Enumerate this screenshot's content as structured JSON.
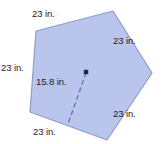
{
  "figure": {
    "kind": "regular-pentagon-with-apothem",
    "fill_color": "#b9c5ec",
    "stroke_color": "#8f9dc8",
    "center_dot_color": "#1b2a55",
    "dashed_line_color": "#6b7bb0",
    "text_color": "#1c1c1c",
    "vertices": [
      {
        "name": "top-left",
        "x": 36,
        "y": 31
      },
      {
        "name": "top-right",
        "x": 113,
        "y": 11
      },
      {
        "name": "right",
        "x": 152,
        "y": 73
      },
      {
        "name": "bottom-right",
        "x": 107,
        "y": 140
      },
      {
        "name": "bottom-left",
        "x": 30,
        "y": 112
      }
    ],
    "center": {
      "x": 86,
      "y": 72
    },
    "apothem_foot": {
      "x": 68,
      "y": 124
    }
  },
  "labels": {
    "side_top": "23 in.",
    "side_top_right": "23 in.",
    "side_left": "23 in.",
    "side_bottom": "23 in.",
    "side_bottom_right": "23 in.",
    "apothem": "15.8 in."
  }
}
